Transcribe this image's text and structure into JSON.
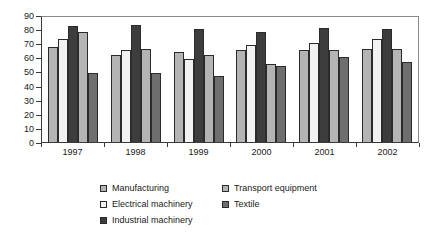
{
  "chart_data": {
    "type": "bar",
    "title": "",
    "subtitle": "",
    "xlabel": "",
    "ylabel": "",
    "categories": [
      "1997",
      "1998",
      "1999",
      "2000",
      "2001",
      "2002"
    ],
    "series": [
      {
        "name": "Manufacturing",
        "color": "#b4b4b4",
        "values": [
          67,
          62,
          64,
          65,
          65,
          66
        ]
      },
      {
        "name": "Electrical machinery",
        "color": "#f2f2f2",
        "values": [
          73,
          65,
          59,
          69,
          70,
          73
        ]
      },
      {
        "name": "Industrial machinery",
        "color": "#3d3d3d",
        "values": [
          82,
          83,
          80,
          78,
          81,
          80
        ]
      },
      {
        "name": "Transport equipment",
        "color": "#b4b4b4",
        "values": [
          78,
          66,
          62,
          55,
          65,
          66
        ]
      },
      {
        "name": "Textile",
        "color": "#6e6e6e",
        "values": [
          49,
          49,
          47,
          54,
          60,
          57
        ]
      }
    ],
    "ylim": [
      0,
      90
    ],
    "yticks": [
      0,
      10,
      20,
      30,
      40,
      50,
      60,
      70,
      80,
      90
    ],
    "ytick_labels": [
      "0",
      "10",
      "20",
      "30",
      "40",
      "50",
      "60",
      "70",
      "80",
      "90"
    ],
    "grid": false,
    "legend_position": "bottom",
    "legend_layout": "two-columns",
    "legend_order": [
      "Manufacturing",
      "Transport equipment",
      "Electrical machinery",
      "Textile",
      "Industrial machinery"
    ]
  }
}
